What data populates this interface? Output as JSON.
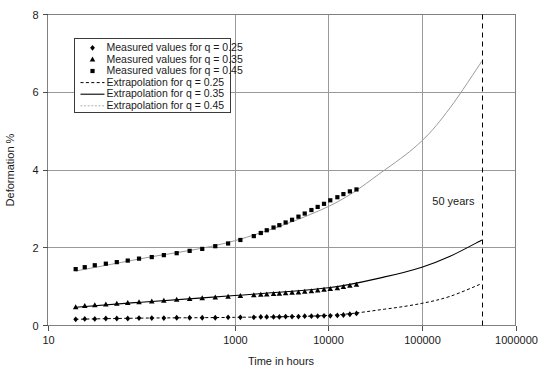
{
  "chart_data": {
    "type": "line",
    "title": "",
    "xlabel": "Time in hours",
    "ylabel": "Deformation %",
    "xscale": "log",
    "xlim": [
      10,
      1000000
    ],
    "ylim": [
      0,
      8
    ],
    "xticks": [
      10,
      1000,
      10000,
      100000,
      1000000
    ],
    "xtick_labels": [
      "10",
      "1000",
      "10000",
      "100000",
      "1000000"
    ],
    "yticks": [
      0,
      2,
      4,
      6,
      8
    ],
    "ytick_labels": [
      "0",
      "2",
      "4",
      "6",
      "8"
    ],
    "grid": "vertical gridlines at 1000, 10000, 100000; horizontal gridlines at 2, 4, 6, 8",
    "legend_position": "upper-left inside axes",
    "annotations": [
      {
        "text": "50 years",
        "x": 438000,
        "y": 3.1,
        "marker": "vertical dashed line at 438000 hours"
      }
    ],
    "series": [
      {
        "name": "Measured values for q = 0.25",
        "marker": "diamond",
        "line": "none",
        "color": "#000000",
        "x": [
          20,
          25,
          32,
          42,
          55,
          72,
          95,
          130,
          175,
          240,
          330,
          450,
          620,
          850,
          1150,
          1600,
          1900,
          2200,
          2600,
          3000,
          3500,
          4100,
          4800,
          5600,
          6600,
          7700,
          9000,
          10500,
          12500,
          14500,
          17000,
          20000
        ],
        "y": [
          0.16,
          0.17,
          0.17,
          0.18,
          0.18,
          0.18,
          0.19,
          0.19,
          0.19,
          0.2,
          0.2,
          0.2,
          0.2,
          0.21,
          0.21,
          0.21,
          0.22,
          0.22,
          0.22,
          0.22,
          0.23,
          0.23,
          0.23,
          0.24,
          0.24,
          0.24,
          0.25,
          0.25,
          0.26,
          0.27,
          0.29,
          0.31
        ]
      },
      {
        "name": "Measured values for q = 0.35",
        "marker": "triangle",
        "line": "none",
        "color": "#000000",
        "x": [
          20,
          25,
          32,
          42,
          55,
          72,
          95,
          130,
          175,
          240,
          330,
          450,
          620,
          850,
          1150,
          1600,
          1900,
          2200,
          2600,
          3000,
          3500,
          4100,
          4800,
          5600,
          6600,
          7700,
          9000,
          10500,
          12500,
          14500,
          17000,
          20000
        ],
        "y": [
          0.47,
          0.5,
          0.52,
          0.54,
          0.56,
          0.58,
          0.6,
          0.62,
          0.64,
          0.66,
          0.68,
          0.7,
          0.72,
          0.74,
          0.76,
          0.78,
          0.79,
          0.8,
          0.81,
          0.82,
          0.83,
          0.84,
          0.85,
          0.87,
          0.88,
          0.9,
          0.92,
          0.94,
          0.96,
          0.99,
          1.02,
          1.05
        ]
      },
      {
        "name": "Measured values for q = 0.45",
        "marker": "square",
        "line": "none",
        "color": "#000000",
        "x": [
          20,
          25,
          32,
          42,
          55,
          72,
          95,
          130,
          175,
          240,
          330,
          450,
          620,
          850,
          1150,
          1600,
          1900,
          2200,
          2600,
          3000,
          3500,
          4100,
          4800,
          5600,
          6600,
          7700,
          9000,
          10500,
          12500,
          14500,
          17000,
          20000
        ],
        "y": [
          1.45,
          1.5,
          1.55,
          1.59,
          1.63,
          1.67,
          1.72,
          1.76,
          1.81,
          1.86,
          1.92,
          1.97,
          2.04,
          2.11,
          2.2,
          2.3,
          2.38,
          2.45,
          2.52,
          2.58,
          2.65,
          2.72,
          2.8,
          2.88,
          2.97,
          3.05,
          3.13,
          3.22,
          3.3,
          3.38,
          3.45,
          3.5
        ]
      },
      {
        "name": "Extrapolation for q = 0.25",
        "marker": "none",
        "line": "dashed",
        "color": "#000000",
        "x": [
          20,
          100,
          1000,
          10000,
          40000,
          100000,
          200000,
          438000
        ],
        "y": [
          0.16,
          0.19,
          0.21,
          0.26,
          0.42,
          0.57,
          0.75,
          1.08
        ]
      },
      {
        "name": "Extrapolation for q = 0.35",
        "marker": "none",
        "line": "solid",
        "color": "#000000",
        "x": [
          20,
          100,
          1000,
          10000,
          40000,
          100000,
          200000,
          438000
        ],
        "y": [
          0.47,
          0.6,
          0.77,
          0.97,
          1.25,
          1.5,
          1.78,
          2.2
        ]
      },
      {
        "name": "Extrapolation for q = 0.45",
        "marker": "none",
        "line": "solid-light",
        "color": "#9a9a9a",
        "x": [
          20,
          100,
          1000,
          10000,
          40000,
          100000,
          200000,
          438000
        ],
        "y": [
          1.4,
          1.72,
          2.18,
          3.06,
          4.0,
          4.75,
          5.6,
          6.8
        ]
      }
    ]
  },
  "legend": {
    "entries": [
      {
        "label": "Measured values for q = 0.25",
        "glyph": "diamond-marker"
      },
      {
        "label": "Measured values for q = 0.35",
        "glyph": "triangle-marker"
      },
      {
        "label": "Measured values for q = 0.45",
        "glyph": "square-marker"
      },
      {
        "label": "Extrapolation for q = 0.25",
        "glyph": "dashed-line"
      },
      {
        "label": "Extrapolation for q = 0.35",
        "glyph": "solid-line"
      },
      {
        "label": "Extrapolation for q = 0.45",
        "glyph": "light-dotted-line"
      }
    ]
  },
  "colors": {
    "axis": "#808080",
    "grid": "#9a9a9a",
    "data": "#000000",
    "light_curve": "#9a9a9a",
    "text": "#1a1a1a"
  }
}
